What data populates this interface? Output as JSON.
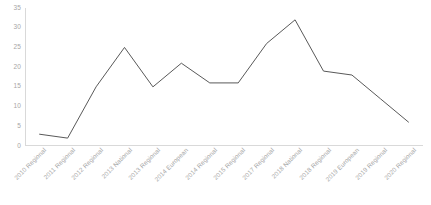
{
  "chart_data": {
    "type": "line",
    "title": "",
    "subtitle": "",
    "xlabel": "",
    "ylabel": "",
    "ylim": [
      0,
      35
    ],
    "ytick_step": 5,
    "yticks": [
      35,
      30,
      25,
      20,
      15,
      10,
      5,
      0
    ],
    "grid": false,
    "legend": "none",
    "line_color": "#595959",
    "axis_color": "#d9d9d9",
    "tick_label_color": "#a6a6a6",
    "categories": [
      "2010 Regional",
      "2011 Regional",
      "2012 Regional",
      "2013 National",
      "2013 Regional",
      "2014 European",
      "2014 Regional",
      "2015 Regional",
      "2017 Regional",
      "2018 National",
      "2018 Regional",
      "2019 European",
      "2019 Regional",
      "2020 Regional"
    ],
    "values": [
      3,
      2,
      15,
      25,
      15,
      21,
      16,
      16,
      26,
      32,
      19,
      18,
      12,
      6
    ],
    "series": [
      {
        "name": "",
        "values": [
          3,
          2,
          15,
          25,
          15,
          21,
          16,
          16,
          26,
          32,
          19,
          18,
          12,
          6
        ]
      }
    ]
  }
}
